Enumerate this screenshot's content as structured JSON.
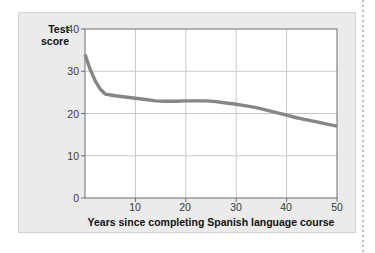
{
  "figure": {
    "panel_background": "#ebebeb",
    "panel_border_color": "#d2d2d2",
    "plot_background": "#ffffff",
    "plot_border_color": "#6e6e6e",
    "grid_color": "#c9c9c9",
    "line_color": "#868686",
    "tick_text_color": "#3a3a3a",
    "title_text_color": "#121212"
  },
  "labels": {
    "y_axis_line_1": "Test",
    "y_axis_line_2": "score",
    "x_axis_title": "Years since completing Spanish language course",
    "y_ticks": [
      "0",
      "10",
      "20",
      "30",
      "40"
    ],
    "x_ticks": [
      "10",
      "20",
      "30",
      "40",
      "50"
    ]
  },
  "chart_data": {
    "type": "line",
    "title": "",
    "subtitle": "",
    "xlabel": "Years since completing Spanish language course",
    "ylabel": "Test score",
    "xlim": [
      0,
      50
    ],
    "ylim": [
      0,
      40
    ],
    "xticks": [
      10,
      20,
      30,
      40,
      50
    ],
    "yticks": [
      0,
      10,
      20,
      30,
      40
    ],
    "grid": true,
    "legend": false,
    "legend_position": "none",
    "annotations": [],
    "series": [
      {
        "name": "Test score",
        "color": "#868686",
        "x": [
          0,
          1,
          2,
          3,
          4,
          6,
          8,
          10,
          12,
          14,
          16,
          18,
          20,
          22,
          24,
          26,
          28,
          30,
          32,
          34,
          36,
          38,
          40,
          42,
          44,
          46,
          48,
          50
        ],
        "y": [
          34.0,
          30.5,
          27.8,
          25.8,
          24.6,
          24.2,
          23.9,
          23.6,
          23.3,
          23.0,
          22.9,
          22.9,
          23.0,
          23.0,
          23.0,
          22.8,
          22.5,
          22.2,
          21.8,
          21.4,
          20.8,
          20.2,
          19.6,
          19.0,
          18.5,
          18.0,
          17.5,
          17.0
        ]
      }
    ]
  }
}
